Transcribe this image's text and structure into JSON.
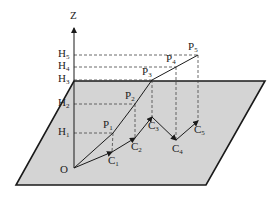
{
  "figure": {
    "type": "3d-path-projection-diagram",
    "colors": {
      "plane_fill": "#d4d4d4",
      "stroke": "#1a1a1a",
      "dashed": "#444444",
      "background": "#ffffff"
    },
    "axis_label": "Z",
    "origin_label": "O",
    "plane": [
      [
        74,
        81
      ],
      [
        265,
        81
      ],
      [
        206,
        185
      ],
      [
        16,
        185
      ]
    ],
    "origin": [
      74,
      168
    ],
    "axis_top": [
      74,
      28
    ],
    "heights": [
      {
        "base": "H",
        "sub": "1",
        "y": 133
      },
      {
        "base": "H",
        "sub": "2",
        "y": 104
      },
      {
        "base": "H",
        "sub": "3",
        "y": 80
      },
      {
        "base": "H",
        "sub": "4",
        "y": 67
      },
      {
        "base": "H",
        "sub": "5",
        "y": 55
      }
    ],
    "points_p": [
      {
        "base": "P",
        "sub": "1",
        "x": 113,
        "y": 133
      },
      {
        "base": "P",
        "sub": "2",
        "x": 135,
        "y": 104
      },
      {
        "base": "P",
        "sub": "3",
        "x": 152,
        "y": 80
      },
      {
        "base": "P",
        "sub": "4",
        "x": 176,
        "y": 67
      },
      {
        "base": "P",
        "sub": "5",
        "x": 198,
        "y": 55
      }
    ],
    "points_c": [
      {
        "base": "C",
        "sub": "1",
        "x": 112,
        "y": 152
      },
      {
        "base": "C",
        "sub": "2",
        "x": 135,
        "y": 138
      },
      {
        "base": "C",
        "sub": "3",
        "x": 152,
        "y": 117
      },
      {
        "base": "C",
        "sub": "4",
        "x": 176,
        "y": 140
      },
      {
        "base": "C",
        "sub": "5",
        "x": 198,
        "y": 121
      }
    ]
  }
}
